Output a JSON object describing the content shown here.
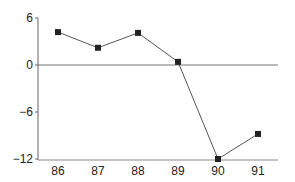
{
  "chart_data": {
    "type": "line",
    "title": "",
    "xlabel": "",
    "ylabel": "",
    "categories": [
      "86",
      "87",
      "88",
      "89",
      "90",
      "91"
    ],
    "series": [
      {
        "name": "series-1",
        "values": [
          4.2,
          2.2,
          4.1,
          0.4,
          -12,
          -8.8
        ],
        "marker": "square",
        "color": "#555555"
      }
    ],
    "ylim": [
      -12,
      6
    ],
    "yticks": [
      6,
      0,
      -6,
      -12
    ],
    "ytick_labels": [
      "6",
      "0",
      "−6",
      "−12"
    ],
    "reference_line_y": 0,
    "grid": false,
    "legend": "none"
  }
}
